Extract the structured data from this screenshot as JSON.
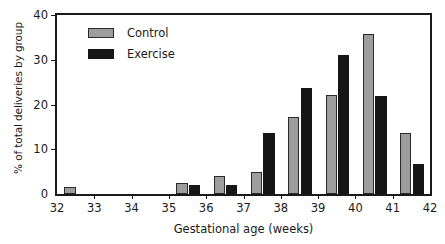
{
  "chart_data": {
    "type": "bar",
    "title": "",
    "subtitle": "",
    "xlabel": "Gestational age (weeks)",
    "ylabel": "% of total deliveries by group",
    "categories": [
      "32",
      "33",
      "34",
      "35",
      "36",
      "37",
      "38",
      "39",
      "40",
      "41"
    ],
    "series": [
      {
        "name": "Control",
        "color": "#9d9d9d",
        "values": [
          1.5,
          0,
          0,
          2.5,
          4.0,
          5.0,
          17.2,
          22.2,
          35.7,
          13.6
        ]
      },
      {
        "name": "Exercise",
        "color": "#161616",
        "values": [
          0,
          0,
          0,
          2.0,
          2.0,
          13.7,
          23.8,
          31.0,
          22.0,
          6.8
        ]
      }
    ],
    "xlim": [
      32,
      42
    ],
    "ylim": [
      0,
      40
    ],
    "xticks": [
      "32",
      "33",
      "34",
      "35",
      "36",
      "37",
      "38",
      "39",
      "40",
      "41",
      "42"
    ],
    "yticks": [
      "0",
      "10",
      "20",
      "30",
      "40"
    ],
    "grid": false,
    "legend_position": "top-left",
    "legend": [
      {
        "label": "Control",
        "color": "#9d9d9d",
        "swatch": "gray-filled-rect"
      },
      {
        "label": "Exercise",
        "color": "#161616",
        "swatch": "black-filled-rect"
      }
    ]
  },
  "axis": {
    "frame_color": "#1a1a1a",
    "background": "#ffffff"
  }
}
